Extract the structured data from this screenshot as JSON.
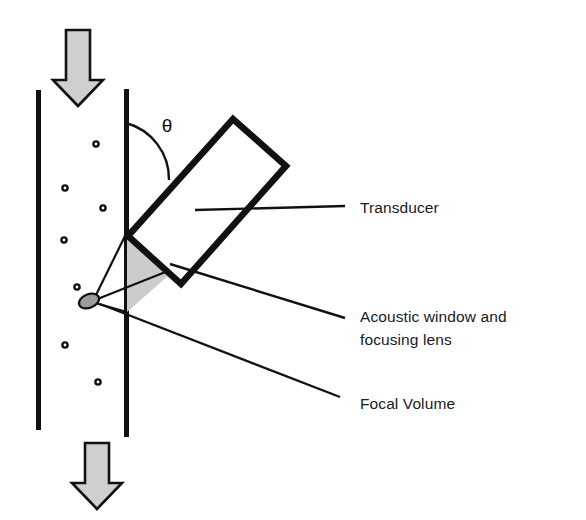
{
  "figure": {
    "type": "technical-diagram",
    "background_color": "#ffffff",
    "stroke_color": "#111111",
    "shade_color": "#cccccc",
    "arrow_fill": "#cfcfcf"
  },
  "labels": {
    "transducer": "Transducer",
    "acoustic_window_line1": "Acoustic window and",
    "acoustic_window_line2": "focusing lens",
    "focal_volume": "Focal Volume",
    "angle_symbol": "θ"
  },
  "geometry": {
    "left_wall": {
      "x": 38,
      "y_top": 90,
      "y_bottom": 430,
      "width": 5
    },
    "right_wall": {
      "x": 126,
      "y_top": 89,
      "y_bottom": 437,
      "width": 5
    },
    "flow_arrow_top": {
      "cx": 78,
      "y_top": 30,
      "y_bottom": 105
    },
    "flow_arrow_bottom": {
      "cx": 97,
      "y_top": 443,
      "y_bottom": 508
    },
    "transducer_rect": {
      "corners": [
        [
          128,
          235
        ],
        [
          232,
          119
        ],
        [
          285,
          166
        ],
        [
          181,
          283
        ]
      ],
      "angle_deg": 48
    },
    "angle_arc": {
      "cx": 126,
      "cy": 121,
      "r": 56,
      "start_deg": 0,
      "end_deg": 48
    },
    "acoustic_window_triangle": [
      [
        127,
        232
      ],
      [
        127,
        312
      ],
      [
        176,
        268
      ]
    ],
    "focal_volume_ellipse": {
      "cx": 89,
      "cy": 301,
      "rx": 10,
      "ry": 6.5,
      "rotate_deg": -22
    },
    "beam_cone": [
      [
        96,
        296
      ],
      [
        127,
        232
      ],
      [
        176,
        268
      ],
      [
        127,
        312
      ]
    ]
  },
  "particles": [
    {
      "cx": 96,
      "cy": 144
    },
    {
      "cx": 65,
      "cy": 188
    },
    {
      "cx": 103,
      "cy": 208
    },
    {
      "cx": 64,
      "cy": 240
    },
    {
      "cx": 77,
      "cy": 287
    },
    {
      "cx": 65,
      "cy": 345
    },
    {
      "cx": 98,
      "cy": 382
    }
  ],
  "leader_lines": [
    {
      "name": "transducer",
      "from": [
        195,
        210
      ],
      "to": [
        345,
        206
      ]
    },
    {
      "name": "acoustic-window",
      "from": [
        170,
        264
      ],
      "to": [
        345,
        318
      ]
    },
    {
      "name": "focal-volume",
      "from": [
        100,
        303
      ],
      "to": [
        340,
        396
      ]
    }
  ],
  "text_positions": {
    "transducer": {
      "x": 360,
      "y": 213
    },
    "acoustic_window_line1": {
      "x": 360,
      "y": 322
    },
    "acoustic_window_line2": {
      "x": 360,
      "y": 345
    },
    "focal_volume": {
      "x": 360,
      "y": 408
    },
    "angle_symbol": {
      "x": 167,
      "y": 132
    }
  }
}
